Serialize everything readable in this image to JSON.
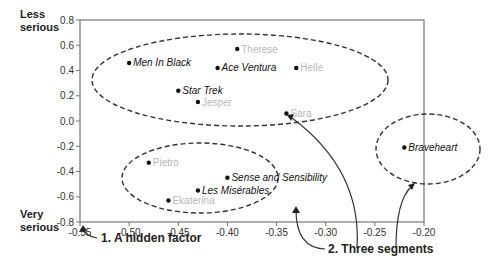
{
  "chart_data": {
    "type": "scatter",
    "title": "",
    "xlabel": "",
    "ylabel_top": "Less serious",
    "ylabel_bottom": "Very serious",
    "xlim": [
      -0.55,
      -0.2
    ],
    "ylim": [
      -0.8,
      0.8
    ],
    "grid": false,
    "x_ticks": [
      "-0.55",
      "-0.50",
      "-0.45",
      "-0.40",
      "-0.35",
      "-0.30",
      "-0.25",
      "-0.20"
    ],
    "y_ticks": [
      "0.8",
      "0.6",
      "0.4",
      "0.2",
      "0.0",
      "-0.2",
      "-0.4",
      "-0.6",
      "-0.8"
    ],
    "points": [
      {
        "label": "Men In Black",
        "x": -0.5,
        "y": 0.46,
        "kind": "movie"
      },
      {
        "label": "Therese",
        "x": -0.39,
        "y": 0.57,
        "kind": "person"
      },
      {
        "label": "Ace Ventura",
        "x": -0.41,
        "y": 0.42,
        "kind": "movie"
      },
      {
        "label": "Helle",
        "x": -0.33,
        "y": 0.42,
        "kind": "person"
      },
      {
        "label": "Star Trek",
        "x": -0.45,
        "y": 0.24,
        "kind": "movie"
      },
      {
        "label": "Jesper",
        "x": -0.43,
        "y": 0.15,
        "kind": "person"
      },
      {
        "label": "Sara",
        "x": -0.34,
        "y": 0.06,
        "kind": "person"
      },
      {
        "label": "Braveheart",
        "x": -0.22,
        "y": -0.21,
        "kind": "movie"
      },
      {
        "label": "Pietro",
        "x": -0.48,
        "y": -0.33,
        "kind": "person"
      },
      {
        "label": "Sense and Sensibility",
        "x": -0.4,
        "y": -0.45,
        "kind": "movie"
      },
      {
        "label": "Les Misérables",
        "x": -0.43,
        "y": -0.55,
        "kind": "movie"
      },
      {
        "label": "Ekaterina",
        "x": -0.46,
        "y": -0.63,
        "kind": "person"
      }
    ],
    "segments": [
      {
        "name": "upper-segment",
        "members": [
          "Men In Black",
          "Therese",
          "Ace Ventura",
          "Helle",
          "Star Trek",
          "Jesper",
          "Sara"
        ]
      },
      {
        "name": "lower-segment",
        "members": [
          "Pietro",
          "Sense and Sensibility",
          "Les Misérables",
          "Ekaterina"
        ]
      },
      {
        "name": "right-segment",
        "members": [
          "Braveheart"
        ]
      }
    ],
    "annotations": [
      {
        "text": "1.  A hidden factor",
        "points_to": "x-axis"
      },
      {
        "text": "2. Three segments",
        "points_to": "segment ellipses"
      }
    ]
  },
  "labels": {
    "ylabel_top_1": "Less",
    "ylabel_top_2": "serious",
    "ylabel_bottom_1": "Very",
    "ylabel_bottom_2": "serious",
    "annotation_1": "1.  A hidden factor",
    "annotation_2": "2. Three segments"
  }
}
